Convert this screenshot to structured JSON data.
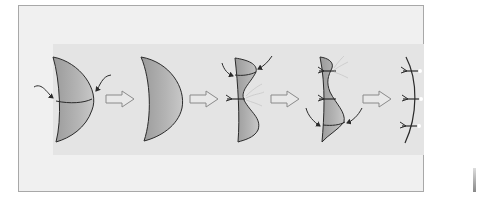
{
  "figure": {
    "steps": [
      {
        "index": 1,
        "label": "crescent flap with transverse line and two curved arrows"
      },
      {
        "index": 2,
        "label": "crescent flap"
      },
      {
        "index": 3,
        "label": "flap with wavy folded edge, one suture and curved arrows"
      },
      {
        "index": 4,
        "label": "narrowed flap with two sutures and curved arrows"
      },
      {
        "index": 5,
        "label": "final curved line with three sutures"
      }
    ],
    "arrows_between_steps": 4,
    "colors": {
      "frame_bg": "#f0f0f0",
      "band_bg": "#e4e4e4",
      "flap_fill": "#a8a8a8",
      "line": "#2a2a2a",
      "arrow_fill": "#e8e8e8",
      "arrow_stroke": "#8a8a8a"
    }
  }
}
